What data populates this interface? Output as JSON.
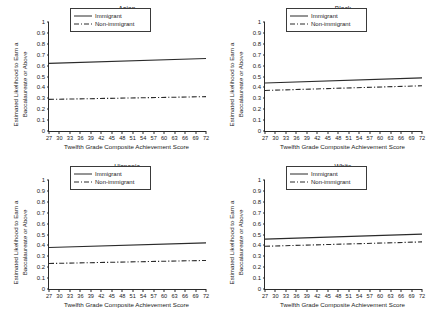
{
  "figure": {
    "background": "#ffffff",
    "line_color": "#2b2b2b",
    "axis_color": "#2b2b2b"
  },
  "axis": {
    "xlabel": "Twelfth Grade Composite Achievement Score",
    "ylabel_line1": "Estimated Likelihood to Earn a",
    "ylabel_line2": "Baccalaureate or Above",
    "xticks": [
      "27",
      "30",
      "33",
      "36",
      "39",
      "42",
      "45",
      "48",
      "51",
      "54",
      "57",
      "60",
      "63",
      "66",
      "69",
      "72"
    ],
    "yticks": [
      "0",
      "0.1",
      "0.2",
      "0.3",
      "0.4",
      "0.5",
      "0.6",
      "0.7",
      "0.8",
      "0.9",
      "1"
    ]
  },
  "legend": {
    "immigrant_label": "Immigrant",
    "nonimmigrant_label": "Non-immigrant"
  },
  "panels": [
    {
      "key": "asian",
      "title": "Asian"
    },
    {
      "key": "black",
      "title": "Black"
    },
    {
      "key": "hispanic",
      "title": "Hispanic"
    },
    {
      "key": "white",
      "title": "White"
    }
  ],
  "chart_data": [
    {
      "type": "line",
      "title": "Asian",
      "xlabel": "Twelfth Grade Composite Achievement Score",
      "ylabel": "Estimated Likelihood to Earn a Baccalaureate or Above",
      "xlim": [
        27,
        72
      ],
      "ylim": [
        0,
        1
      ],
      "xticks": [
        27,
        30,
        33,
        36,
        39,
        42,
        45,
        48,
        51,
        54,
        57,
        60,
        63,
        66,
        69,
        72
      ],
      "yticks": [
        0,
        0.1,
        0.2,
        0.3,
        0.4,
        0.5,
        0.6,
        0.7,
        0.8,
        0.9,
        1
      ],
      "grid": false,
      "legend_position": "upper center",
      "series": [
        {
          "name": "Immigrant",
          "style": "solid",
          "x": [
            27,
            72
          ],
          "values": [
            0.62,
            0.665
          ]
        },
        {
          "name": "Non-immigrant",
          "style": "dash-dot",
          "x": [
            27,
            72
          ],
          "values": [
            0.29,
            0.315
          ]
        }
      ]
    },
    {
      "type": "line",
      "title": "Black",
      "xlabel": "Twelfth Grade Composite Achievement Score",
      "ylabel": "Estimated Likelihood to Earn a Baccalaureate or Above",
      "xlim": [
        27,
        72
      ],
      "ylim": [
        0,
        1
      ],
      "xticks": [
        27,
        30,
        33,
        36,
        39,
        42,
        45,
        48,
        51,
        54,
        57,
        60,
        63,
        66,
        69,
        72
      ],
      "yticks": [
        0,
        0.1,
        0.2,
        0.3,
        0.4,
        0.5,
        0.6,
        0.7,
        0.8,
        0.9,
        1
      ],
      "grid": false,
      "legend_position": "upper center",
      "series": [
        {
          "name": "Immigrant",
          "style": "solid",
          "x": [
            27,
            72
          ],
          "values": [
            0.44,
            0.487
          ]
        },
        {
          "name": "Non-immigrant",
          "style": "dash-dot",
          "x": [
            27,
            72
          ],
          "values": [
            0.372,
            0.415
          ]
        }
      ]
    },
    {
      "type": "line",
      "title": "Hispanic",
      "xlabel": "Twelfth Grade Composite Achievement Score",
      "ylabel": "Estimated Likelihood to Earn a Baccalaureate or Above",
      "xlim": [
        27,
        72
      ],
      "ylim": [
        0,
        1
      ],
      "xticks": [
        27,
        30,
        33,
        36,
        39,
        42,
        45,
        48,
        51,
        54,
        57,
        60,
        63,
        66,
        69,
        72
      ],
      "yticks": [
        0,
        0.1,
        0.2,
        0.3,
        0.4,
        0.5,
        0.6,
        0.7,
        0.8,
        0.9,
        1
      ],
      "grid": false,
      "legend_position": "upper center",
      "series": [
        {
          "name": "Immigrant",
          "style": "solid",
          "x": [
            27,
            72
          ],
          "values": [
            0.381,
            0.423
          ]
        },
        {
          "name": "Non-immigrant",
          "style": "dash-dot",
          "x": [
            27,
            72
          ],
          "values": [
            0.234,
            0.262
          ]
        }
      ]
    },
    {
      "type": "line",
      "title": "White",
      "xlabel": "Twelfth Grade Composite Achievement Score",
      "ylabel": "Estimated Likelihood to Earn a Baccalaureate or Above",
      "xlim": [
        27,
        72
      ],
      "ylim": [
        0,
        1
      ],
      "xticks": [
        27,
        30,
        33,
        36,
        39,
        42,
        45,
        48,
        51,
        54,
        57,
        60,
        63,
        66,
        69,
        72
      ],
      "yticks": [
        0,
        0.1,
        0.2,
        0.3,
        0.4,
        0.5,
        0.6,
        0.7,
        0.8,
        0.9,
        1
      ],
      "grid": false,
      "legend_position": "upper center",
      "series": [
        {
          "name": "Immigrant",
          "style": "solid",
          "x": [
            27,
            72
          ],
          "values": [
            0.458,
            0.503
          ]
        },
        {
          "name": "Non-immigrant",
          "style": "dash-dot",
          "x": [
            27,
            72
          ],
          "values": [
            0.392,
            0.432
          ]
        }
      ]
    }
  ]
}
